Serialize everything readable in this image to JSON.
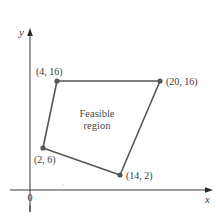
{
  "diagram": {
    "type": "feasible-region-plot",
    "axes": {
      "x_label": "x",
      "y_label": "y",
      "origin_label": "0"
    },
    "region": {
      "label_line1": "Feasible",
      "label_line2": "region"
    },
    "vertices": [
      {
        "x": 4,
        "y": 16,
        "label": "(4, 16)"
      },
      {
        "x": 20,
        "y": 16,
        "label": "(20, 16)"
      },
      {
        "x": 14,
        "y": 2,
        "label": "(14, 2)"
      },
      {
        "x": 2,
        "y": 6,
        "label": "(2, 6)"
      }
    ],
    "colors": {
      "axis": "#3a3a3a",
      "edge": "#555555",
      "vertex": "#555555",
      "text": "#3a3a3a"
    }
  }
}
